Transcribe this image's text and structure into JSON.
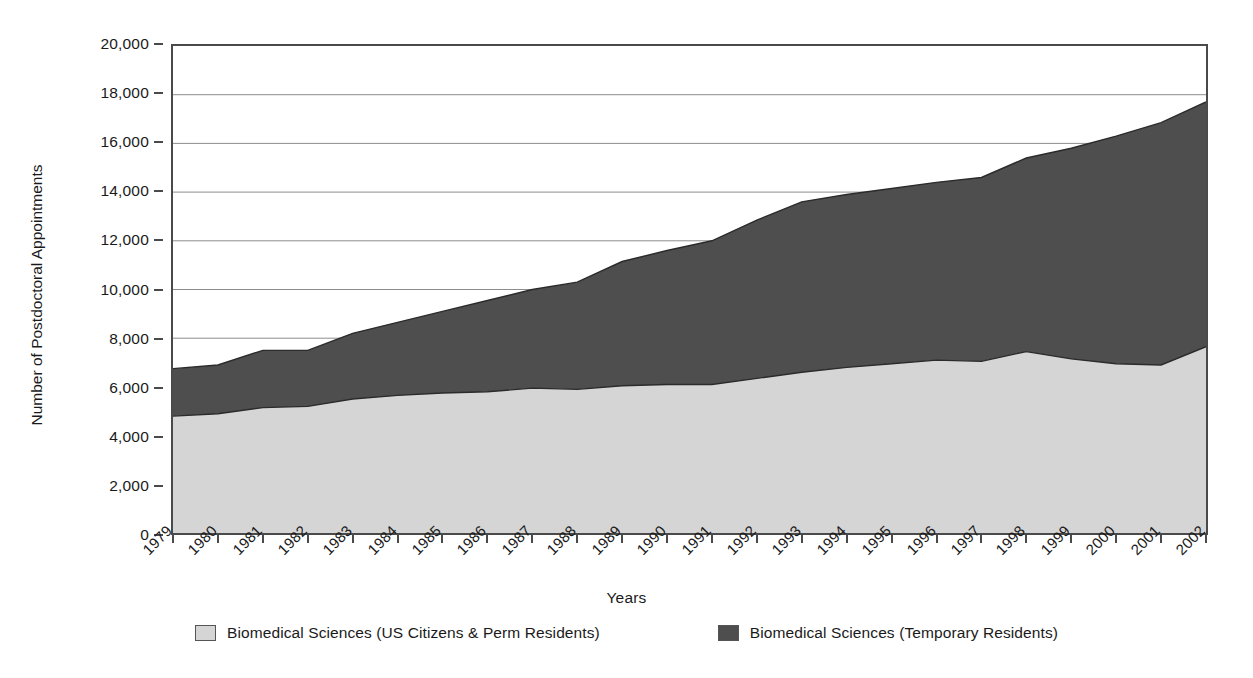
{
  "chart_data": {
    "type": "area",
    "stacked": true,
    "title": "",
    "xlabel": "Years",
    "ylabel": "Number of Postdoctoral Appointments",
    "ylim": [
      0,
      20000
    ],
    "ytick_labels": [
      "0",
      "2,000",
      "4,000",
      "6,000",
      "8,000",
      "10,000",
      "12,000",
      "14,000",
      "16,000",
      "18,000",
      "20,000"
    ],
    "ytick_values": [
      0,
      2000,
      4000,
      6000,
      8000,
      10000,
      12000,
      14000,
      16000,
      18000,
      20000
    ],
    "grid": true,
    "grid_axis": "y",
    "legend_position": "bottom",
    "categories": [
      "1979",
      "1980",
      "1981",
      "1982",
      "1983",
      "1984",
      "1985",
      "1986",
      "1987",
      "1988",
      "1989",
      "1990",
      "1991",
      "1992",
      "1993",
      "1994",
      "1995",
      "1996",
      "1997",
      "1998",
      "1999",
      "2000",
      "2001",
      "2002"
    ],
    "series": [
      {
        "name": "Biomedical Sciences (US Citizens & Perm Residents)",
        "color": "#d5d5d5",
        "values": [
          4800,
          4900,
          5150,
          5200,
          5500,
          5650,
          5750,
          5800,
          5950,
          5900,
          6050,
          6100,
          6100,
          6350,
          6600,
          6800,
          6950,
          7100,
          7050,
          7450,
          7150,
          6950,
          6900,
          7650
        ]
      },
      {
        "name": "Biomedical Sciences (Temporary Residents)",
        "color": "#4e4e4e",
        "values": [
          1950,
          2000,
          2350,
          2300,
          2700,
          3000,
          3350,
          3750,
          4050,
          4400,
          5100,
          5500,
          5900,
          6500,
          7000,
          7100,
          7200,
          7300,
          7550,
          7950,
          8650,
          9350,
          9950,
          10050
        ]
      }
    ],
    "totals": [
      6750,
      6900,
      7500,
      7500,
      8200,
      8650,
      9100,
      9550,
      10000,
      10300,
      11150,
      11600,
      12000,
      12850,
      13600,
      13900,
      14150,
      14400,
      14600,
      15400,
      15800,
      16300,
      16850,
      17700
    ]
  },
  "colors": {
    "series_light": "#d5d5d5",
    "series_dark": "#4e4e4e",
    "axis": "#4a4a4a",
    "grid": "#8d8d8d",
    "outline": "#2b2b2b",
    "text": "#1a1a1a"
  }
}
